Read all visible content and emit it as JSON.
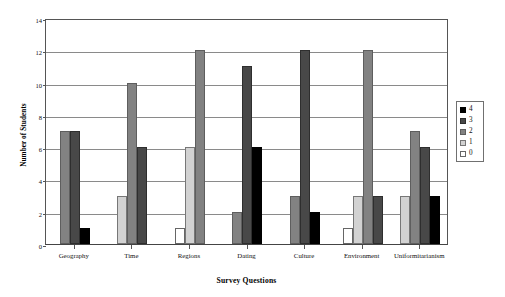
{
  "chart_data": {
    "type": "bar",
    "title": "",
    "xlabel": "Survey Questions",
    "ylabel": "Number of Students",
    "categories": [
      "Geography",
      "Time",
      "Regions",
      "Dating",
      "Culture",
      "Environment",
      "Uniformitarianism"
    ],
    "series": [
      {
        "name": "4",
        "color": "#000000",
        "values": [
          1,
          0,
          0,
          6,
          2,
          0,
          3
        ]
      },
      {
        "name": "3",
        "color": "#484848",
        "values": [
          7,
          6,
          0,
          11,
          12,
          3,
          6
        ]
      },
      {
        "name": "2",
        "color": "#828282",
        "values": [
          7,
          10,
          12,
          2,
          3,
          12,
          7
        ]
      },
      {
        "name": "1",
        "color": "#d2d2d2",
        "values": [
          0,
          3,
          6,
          0,
          0,
          3,
          3
        ]
      },
      {
        "name": "0",
        "color": "#ffffff",
        "values": [
          0,
          0,
          1,
          0,
          0,
          1,
          0
        ]
      }
    ],
    "series_draw_order": [
      "0",
      "1",
      "2",
      "3",
      "4"
    ],
    "ylim": [
      0,
      14
    ],
    "ytick_values": [
      0,
      2,
      4,
      6,
      8,
      10,
      12,
      14
    ],
    "ytick_labels": [
      "0",
      "2",
      "4",
      "6",
      "8",
      "10",
      "12",
      "14"
    ],
    "grid": true,
    "grid_axis": "y",
    "legend_position": "right",
    "legend_entries": [
      "4",
      "3",
      "2",
      "1",
      "0"
    ]
  }
}
